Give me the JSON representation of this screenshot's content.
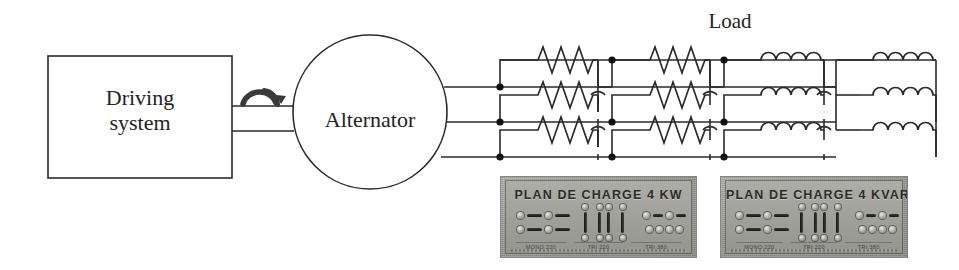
{
  "diagram": {
    "driving_system": {
      "line1": "Driving",
      "line2": "system"
    },
    "alternator": {
      "label": "Alternator"
    },
    "load": {
      "label": "Load"
    },
    "shaft": {
      "icon": "rotation-arrow-icon"
    },
    "phases": [
      {
        "name": "phase-1",
        "y": 87
      },
      {
        "name": "phase-2",
        "y": 122
      },
      {
        "name": "phase-3",
        "y": 157
      }
    ],
    "load_banks": [
      {
        "name": "resistor-bank-1",
        "element": "resistor",
        "symbol": "zigzag",
        "count": 3
      },
      {
        "name": "resistor-bank-2",
        "element": "resistor",
        "symbol": "zigzag",
        "count": 3
      },
      {
        "name": "inductor-bank-1",
        "element": "inductor",
        "symbol": "coil",
        "count": 3
      },
      {
        "name": "inductor-bank-2",
        "element": "inductor",
        "symbol": "coil",
        "count": 3
      }
    ],
    "colors": {
      "line": "#2a2a2a",
      "node": "#111111",
      "background": "#ffffff",
      "panel_body": "#9d9d99",
      "panel_text": "#2b2b28"
    }
  },
  "panels": [
    {
      "name": "load-panel-kw",
      "title": "PLAN DE CHARGE 4 KW",
      "sublabels": [
        "MONO 220",
        "TRI 220",
        "TRI 380"
      ]
    },
    {
      "name": "load-panel-kvar",
      "title": "PLAN DE CHARGE 4 KVAR",
      "sublabels": [
        "MONO 220",
        "TRI 220",
        "TRI 380"
      ]
    }
  ]
}
